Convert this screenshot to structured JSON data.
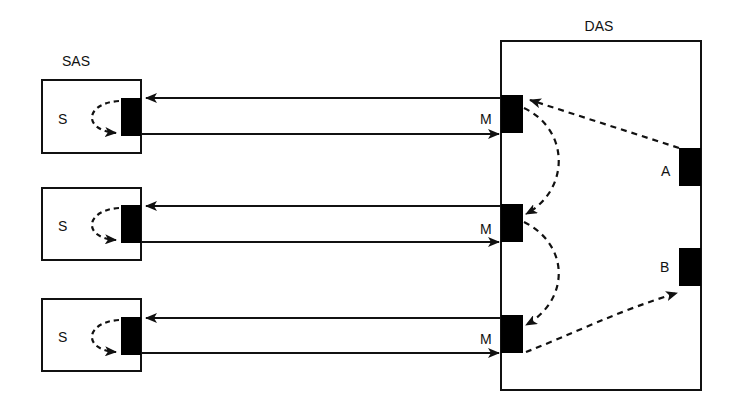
{
  "diagram": {
    "das": {
      "title": "DAS",
      "master_label": "M",
      "port_a": "A",
      "port_b": "B"
    },
    "sas": {
      "title": "SAS",
      "slave_label": "S"
    },
    "units": [
      {
        "slave": "S",
        "master": "M"
      },
      {
        "slave": "S",
        "master": "M"
      },
      {
        "slave": "S",
        "master": "M"
      }
    ],
    "colors": {
      "line": "#111111",
      "fill": "#000000",
      "background": "#ffffff"
    }
  }
}
